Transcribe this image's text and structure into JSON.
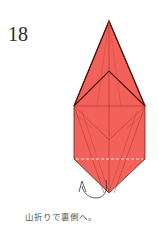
{
  "step": {
    "number": "18"
  },
  "diagram": {
    "paper_color": "#f2625a",
    "outline_color": "#5a1a12",
    "crease_color": "#b03a32",
    "fold_line_color": "#ffffff",
    "arrow_color": "#333333",
    "action": "mountain-fold"
  },
  "caption": {
    "text": "山折りで裏側へ。"
  }
}
